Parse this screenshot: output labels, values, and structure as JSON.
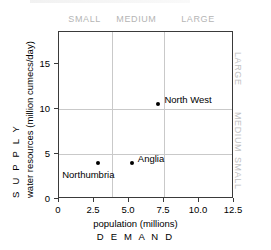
{
  "chart_data": {
    "type": "scatter",
    "title": "",
    "xlabel": "population (millions)",
    "xlabel_secondary": "D E M A N D",
    "ylabel": "water resources (million cumecs/day)",
    "ylabel_secondary": "S U P P L Y",
    "xlim": [
      0,
      12.5
    ],
    "ylim": [
      0,
      18.5
    ],
    "xticks": [
      "0",
      "2.5",
      "5.0",
      "7.5",
      "10.0",
      "12.5"
    ],
    "xtick_values": [
      0,
      2.5,
      5.0,
      7.5,
      10.0,
      12.5
    ],
    "yticks": [
      "0",
      "5",
      "10",
      "15"
    ],
    "ytick_values": [
      0,
      5,
      10,
      15
    ],
    "grid": true,
    "gridlines_x": [
      3.75,
      7.5
    ],
    "gridlines_y": [
      5,
      10
    ],
    "legend": "none",
    "points": [
      {
        "label": "Northumbria",
        "x": 2.8,
        "y": 4.0,
        "label_pos": "below-left"
      },
      {
        "label": "Anglia",
        "x": 5.2,
        "y": 4.0,
        "label_pos": "right"
      },
      {
        "label": "North West",
        "x": 7.1,
        "y": 10.5,
        "label_pos": "right"
      }
    ],
    "category_bands_top": [
      {
        "label": "SMALL",
        "center_x": 1.9
      },
      {
        "label": "MEDIUM",
        "center_x": 5.6
      },
      {
        "label": "LARGE",
        "center_x": 10.0
      }
    ],
    "category_bands_right": [
      {
        "label": "LARGE",
        "center_y": 14.2
      },
      {
        "label": "MEDIUM",
        "center_y": 7.5
      },
      {
        "label": "SMALL",
        "center_y": 2.5
      }
    ]
  },
  "colors": {
    "frame": "#3a3a3a",
    "grid": "#c9c9c9",
    "point": "#000000",
    "text": "#000000",
    "category_text": "#b8b8b8",
    "background": "#ffffff"
  }
}
